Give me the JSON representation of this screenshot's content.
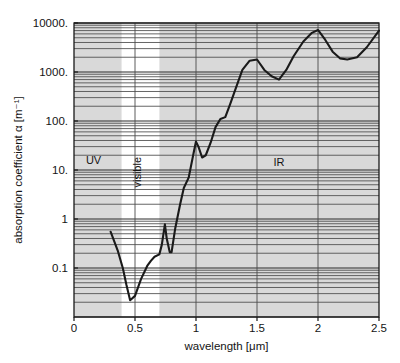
{
  "chart_data": {
    "type": "line",
    "title": "",
    "subtitle": "",
    "xlabel": "wavelength [μm]",
    "ylabel": "absorption coefficient α [m⁻¹]",
    "xscale": "linear",
    "yscale": "log",
    "xlim": [
      0,
      2.5
    ],
    "ylim": [
      0.01,
      10000
    ],
    "xticks": [
      0,
      0.5,
      1,
      1.5,
      2,
      2.5
    ],
    "xtick_labels": [
      "0",
      "0.5",
      "1",
      "1.5",
      "2",
      "2.5"
    ],
    "yticks": [
      0.1,
      1,
      10,
      100,
      1000,
      10000
    ],
    "ytick_labels": [
      "0.1",
      "1",
      "10.",
      "100.",
      "1000.",
      "10000."
    ],
    "grid": "horizontal log minor gridlines, vertical major gridlines",
    "legend": "none",
    "plot_background": "#d9d9d9",
    "line_color": "#1a1a1a",
    "annotations": [
      {
        "text": "UV",
        "x": 0.16,
        "y": 13,
        "name": "uv-region-label"
      },
      {
        "text": "visible",
        "x": 0.55,
        "y": 9,
        "name": "visible-region-label"
      },
      {
        "text": "IR",
        "x": 1.68,
        "y": 12,
        "name": "ir-region-label"
      }
    ],
    "bands": [
      {
        "name": "visible-band",
        "x_start": 0.39,
        "x_end": 0.7,
        "color": "#ffffff"
      }
    ],
    "series": [
      {
        "name": "absorption coefficient",
        "x": [
          0.3,
          0.33,
          0.36,
          0.4,
          0.43,
          0.46,
          0.5,
          0.55,
          0.6,
          0.63,
          0.66,
          0.7,
          0.72,
          0.745,
          0.76,
          0.785,
          0.8,
          0.83,
          0.87,
          0.9,
          0.94,
          0.98,
          1.0,
          1.02,
          1.05,
          1.08,
          1.12,
          1.16,
          1.2,
          1.24,
          1.28,
          1.32,
          1.38,
          1.44,
          1.5,
          1.56,
          1.62,
          1.68,
          1.74,
          1.8,
          1.88,
          1.95,
          2.0,
          2.06,
          2.12,
          2.18,
          2.24,
          2.32,
          2.4,
          2.5
        ],
        "y": [
          0.55,
          0.35,
          0.22,
          0.1,
          0.045,
          0.022,
          0.027,
          0.06,
          0.11,
          0.14,
          0.17,
          0.19,
          0.3,
          0.78,
          0.4,
          0.21,
          0.21,
          0.65,
          2.0,
          4.3,
          7.0,
          22,
          38,
          30,
          18,
          20,
          36,
          75,
          110,
          120,
          220,
          420,
          1100,
          1700,
          1800,
          1100,
          820,
          700,
          1100,
          2100,
          4200,
          6300,
          7200,
          4500,
          2600,
          1900,
          1800,
          2000,
          3200,
          7000
        ]
      }
    ]
  },
  "figure": {
    "plot_area": {
      "left": 74,
      "top": 23,
      "right": 379,
      "bottom": 317
    }
  }
}
